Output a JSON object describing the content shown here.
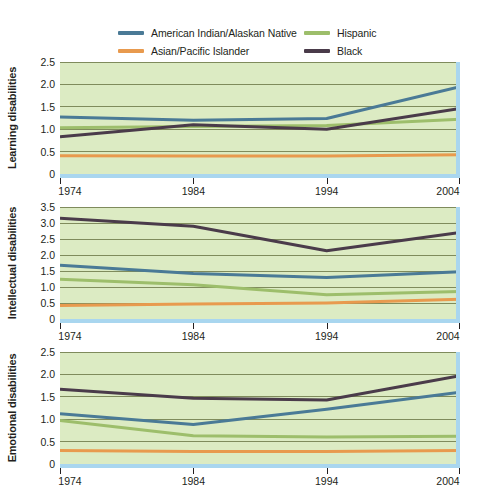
{
  "legend": {
    "position": "top",
    "entries": [
      {
        "label": "American Indian/Alaskan Native",
        "color": "#4a7a96",
        "key": "american-indian-alaskan-native"
      },
      {
        "label": "Hispanic",
        "color": "#9dbe6b",
        "key": "hispanic"
      },
      {
        "label": "Asian/Pacific Islander",
        "color": "#e89a4e",
        "key": "asian-pacific-islander"
      },
      {
        "label": "Black",
        "color": "#4a3b4a",
        "key": "black"
      }
    ]
  },
  "colors": {
    "plot_background": "#dcebc3",
    "gridline": "#6f7a4a",
    "accent_band": "#a9d6ef",
    "text": "#231f20",
    "american_indian": "#4a7a96",
    "hispanic": "#9dbe6b",
    "asian_pacific": "#e89a4e",
    "black": "#4a3b4a"
  },
  "chart_data": [
    {
      "type": "line",
      "title": "",
      "ylabel": "Learning disabilities",
      "xlabel": "",
      "x": [
        1974,
        1984,
        1994,
        2004
      ],
      "xtick_labels": [
        "1974",
        "1984",
        "1994",
        "2004"
      ],
      "ylim": [
        0,
        2.5
      ],
      "ytick_values": [
        0,
        0.5,
        1.0,
        1.5,
        2.0,
        2.5
      ],
      "ytick_labels": [
        "0",
        "0.5",
        "1.0",
        "1.5",
        "2.0",
        "2.5"
      ],
      "grid": true,
      "series": [
        {
          "name": "American Indian/Alaskan Native",
          "color": "#4a7a96",
          "values": [
            1.27,
            1.2,
            1.24,
            1.95
          ]
        },
        {
          "name": "Hispanic",
          "color": "#9dbe6b",
          "values": [
            1.03,
            1.06,
            1.08,
            1.22
          ]
        },
        {
          "name": "Asian/Pacific Islander",
          "color": "#e89a4e",
          "values": [
            0.41,
            0.4,
            0.4,
            0.43
          ]
        },
        {
          "name": "Black",
          "color": "#4a3b4a",
          "values": [
            0.83,
            1.1,
            1.0,
            1.46
          ]
        }
      ]
    },
    {
      "type": "line",
      "title": "",
      "ylabel": "Intellectual disabilities",
      "xlabel": "",
      "x": [
        1974,
        1984,
        1994,
        2004
      ],
      "xtick_labels": [
        "1974",
        "1984",
        "1994",
        "2004"
      ],
      "ylim": [
        0,
        3.5
      ],
      "ytick_values": [
        0,
        0.5,
        1.0,
        1.5,
        2.0,
        2.5,
        3.0,
        3.5
      ],
      "ytick_labels": [
        "0",
        "0.5",
        "1.0",
        "1.5",
        "2.0",
        "2.5",
        "3.0",
        "3.5"
      ],
      "grid": true,
      "series": [
        {
          "name": "American Indian/Alaskan Native",
          "color": "#4a7a96",
          "values": [
            1.68,
            1.42,
            1.3,
            1.48
          ]
        },
        {
          "name": "Hispanic",
          "color": "#9dbe6b",
          "values": [
            1.24,
            1.07,
            0.76,
            0.86
          ]
        },
        {
          "name": "Asian/Pacific Islander",
          "color": "#e89a4e",
          "values": [
            0.42,
            0.47,
            0.5,
            0.62
          ]
        },
        {
          "name": "Black",
          "color": "#4a3b4a",
          "values": [
            3.15,
            2.9,
            2.13,
            2.7
          ]
        }
      ]
    },
    {
      "type": "line",
      "title": "",
      "ylabel": "Emotional disabilities",
      "xlabel": "",
      "x": [
        1974,
        1984,
        1994,
        2004
      ],
      "xtick_labels": [
        "1974",
        "1984",
        "1994",
        "2004"
      ],
      "ylim": [
        0,
        2.5
      ],
      "ytick_values": [
        0,
        0.5,
        1.0,
        1.5,
        2.0,
        2.5
      ],
      "ytick_labels": [
        "0",
        "0.5",
        "1.0",
        "1.5",
        "2.0",
        "2.5"
      ],
      "grid": true,
      "series": [
        {
          "name": "American Indian/Alaskan Native",
          "color": "#4a7a96",
          "values": [
            1.12,
            0.88,
            1.22,
            1.6
          ]
        },
        {
          "name": "Hispanic",
          "color": "#9dbe6b",
          "values": [
            0.97,
            0.63,
            0.6,
            0.62
          ]
        },
        {
          "name": "Asian/Pacific Islander",
          "color": "#e89a4e",
          "values": [
            0.3,
            0.28,
            0.28,
            0.3
          ]
        },
        {
          "name": "Black",
          "color": "#4a3b4a",
          "values": [
            1.67,
            1.47,
            1.43,
            1.97
          ]
        }
      ]
    }
  ]
}
